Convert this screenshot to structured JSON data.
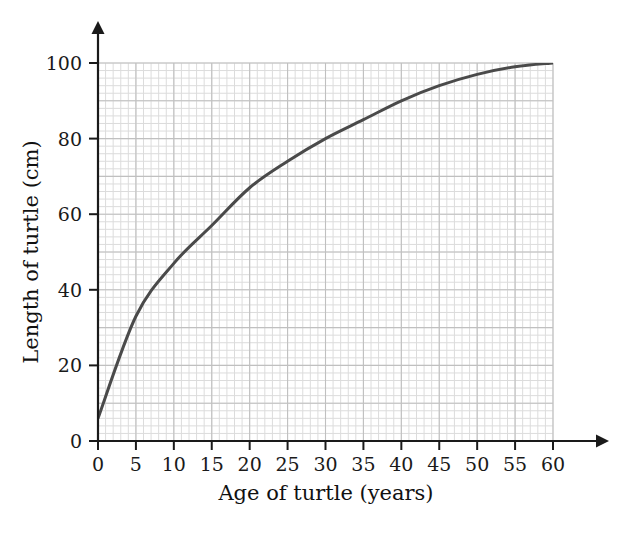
{
  "chart_data": {
    "type": "line",
    "title": "",
    "xlabel": "Age of turtle (years)",
    "ylabel": "Length of turtle (cm)",
    "xlim": [
      0,
      60
    ],
    "ylim": [
      0,
      100
    ],
    "xticks": [
      "0",
      "5",
      "10",
      "15",
      "20",
      "25",
      "30",
      "35",
      "40",
      "45",
      "50",
      "55",
      "60"
    ],
    "xtick_values": [
      0,
      5,
      10,
      15,
      20,
      25,
      30,
      35,
      40,
      45,
      50,
      55,
      60
    ],
    "yticks": [
      "0",
      "20",
      "40",
      "60",
      "80",
      "100"
    ],
    "ytick_values": [
      0,
      20,
      40,
      60,
      80,
      100
    ],
    "grid": "on",
    "grid_minor_step_x": 1,
    "grid_minor_step_y": 2,
    "grid_major_step_x": 5,
    "grid_major_step_y": 10,
    "legend": "none",
    "series": [
      {
        "name": "Length of turtle",
        "x": [
          0,
          5,
          10,
          15,
          20,
          25,
          30,
          35,
          40,
          45,
          50,
          55,
          60
        ],
        "values": [
          6,
          33,
          47,
          57,
          67,
          74,
          80,
          85,
          90,
          94,
          97,
          99,
          100
        ]
      }
    ],
    "colors": {
      "curve": "#4a4a4a",
      "axis": "#1a1a1a",
      "grid_minor": "#dcdcdc",
      "grid_major": "#c0c0c0",
      "background": "#ffffff",
      "text": "#111111"
    }
  },
  "axes": {
    "x_arrow": "arrow-right",
    "y_arrow": "arrow-up"
  }
}
